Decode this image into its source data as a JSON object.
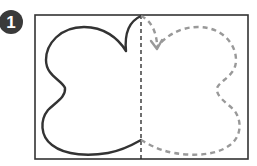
{
  "step": {
    "number": "1",
    "badge_color": "#3a3a3a"
  },
  "diagram": {
    "frame_color": "#333333",
    "fold_line_color": "#222222",
    "solid_shape_color": "#333333",
    "mirror_shape_color": "#999999"
  }
}
